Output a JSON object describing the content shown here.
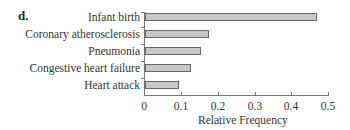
{
  "panel_label": "d.",
  "chart_data": {
    "type": "bar",
    "orientation": "horizontal",
    "title": "",
    "categories": [
      "Infant birth",
      "Coronary atherosclerosis",
      "Pneumonia",
      "Congestive heart failure",
      "Heart attack"
    ],
    "values": [
      0.467,
      0.174,
      0.152,
      0.125,
      0.092
    ],
    "xlabel": "Relative Frequency",
    "ylabel": "",
    "xlim": [
      0,
      0.5
    ],
    "xticks": [
      "0",
      "0.1",
      "0.2",
      "0.3",
      "0.4",
      "0.5"
    ],
    "grid": false,
    "legend": null,
    "bar_color": "#c8c8c8"
  }
}
